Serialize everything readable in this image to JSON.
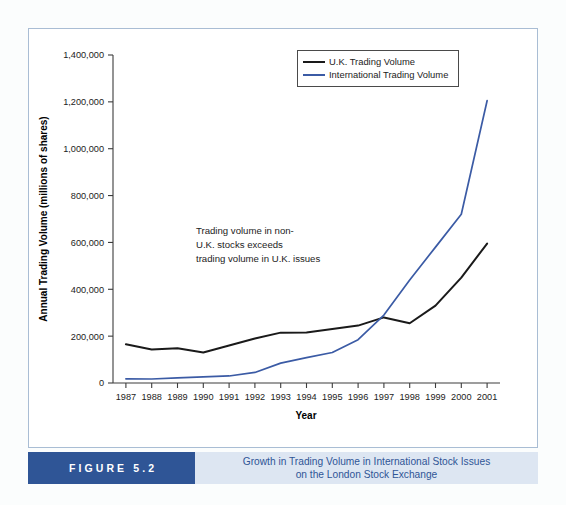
{
  "figure": {
    "number_label": "FIGURE 5.2",
    "caption_line1": "Growth in Trading Volume in International Stock Issues",
    "caption_line2": "on the London Stock Exchange",
    "accent_dark": "#2f5596",
    "accent_light": "#dde6f2",
    "frame_color": "#a9bdd4"
  },
  "annotation": {
    "line1": "Trading volume in non-",
    "line2": "U.K. stocks exceeds",
    "line3": "trading volume in U.K. issues"
  },
  "legend": {
    "items": [
      {
        "label": "U.K. Trading Volume",
        "color": "#1a1a1a"
      },
      {
        "label": "International Trading Volume",
        "color": "#3b5ba5"
      }
    ]
  },
  "chart_data": {
    "type": "line",
    "title": "Growth in Trading Volume in International Stock Issues on the London Stock Exchange",
    "xlabel": "Year",
    "ylabel": "Annual Trading Volume (millions of shares)",
    "categories": [
      "1987",
      "1988",
      "1989",
      "1990",
      "1991",
      "1992",
      "1993",
      "1994",
      "1995",
      "1996",
      "1997",
      "1998",
      "1999",
      "2000",
      "2001"
    ],
    "ylim": [
      0,
      1400000
    ],
    "ytick_values": [
      0,
      200000,
      400000,
      600000,
      800000,
      1000000,
      1200000,
      1400000
    ],
    "ytick_labels": [
      "0",
      "200,000",
      "400,000",
      "600,000",
      "800,000",
      "1,000,000",
      "1,200,000",
      "1,400,000"
    ],
    "grid": false,
    "legend_position": "top-right",
    "series": [
      {
        "name": "U.K. Trading Volume",
        "color": "#1a1a1a",
        "values": [
          165000,
          143000,
          148000,
          130000,
          160000,
          190000,
          215000,
          216000,
          230000,
          245000,
          280000,
          255000,
          330000,
          450000,
          595000
        ]
      },
      {
        "name": "International Trading Volume",
        "color": "#3b5ba5",
        "values": [
          18000,
          17000,
          22000,
          26000,
          30000,
          45000,
          85000,
          108000,
          130000,
          185000,
          290000,
          440000,
          580000,
          720000,
          1205000
        ]
      }
    ],
    "annotations": [
      {
        "text": "Trading volume in non-U.K. stocks exceeds trading volume in U.K. issues",
        "x": "1991",
        "y": 600000
      }
    ]
  }
}
